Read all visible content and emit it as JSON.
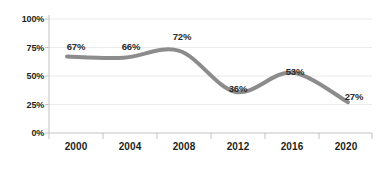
{
  "chart_data": {
    "type": "line",
    "title": "",
    "subtitle": "",
    "xlabel": "",
    "ylabel": "",
    "categories": [
      "2000",
      "2004",
      "2008",
      "2012",
      "2016",
      "2020"
    ],
    "x": [
      2000,
      2004,
      2008,
      2012,
      2016,
      2020
    ],
    "values": [
      67,
      66,
      72,
      36,
      53,
      27
    ],
    "point_labels": [
      "67%",
      "66%",
      "72%",
      "36%",
      "53%",
      "27%"
    ],
    "ylim": [
      0,
      100
    ],
    "y_ticks": [
      0,
      25,
      50,
      75,
      100
    ],
    "y_tick_labels": [
      "0%",
      "25%",
      "50%",
      "75%",
      "100%"
    ],
    "grid": true,
    "grid_axis": "y",
    "legend": false,
    "legend_position": "none",
    "series": [
      {
        "name": "series-1",
        "values": [
          67,
          66,
          72,
          36,
          53,
          27
        ],
        "color": "#8c8c8c",
        "line_width": 4,
        "smooth": true,
        "markers": false
      }
    ],
    "colors": {
      "line": "#8c8c8c",
      "grid": "#eceaea",
      "axis": "#c9c9c9",
      "text": "#231f20",
      "background": "#ffffff"
    }
  }
}
